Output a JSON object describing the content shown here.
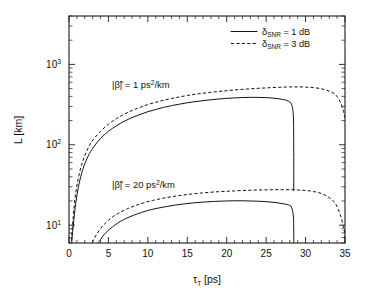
{
  "chart_data": {
    "type": "line",
    "title": "",
    "xlabel": "τ_T  [ps]",
    "xlabel_main": "τ",
    "xlabel_sub": "T",
    "xlabel_unit": "[ps]",
    "ylabel_main": "L",
    "ylabel_unit": "[km]",
    "ylabel": "L  [km]",
    "xlim": [
      0,
      35
    ],
    "ylim": [
      6,
      4000
    ],
    "yscale": "log",
    "xscale": "linear",
    "grid": false,
    "xticks": [
      0,
      5,
      10,
      15,
      20,
      25,
      30,
      35
    ],
    "xticklabels": [
      "0",
      "5",
      "10",
      "15",
      "20",
      "25",
      "30",
      "35"
    ],
    "yticks": [
      10,
      100,
      1000
    ],
    "yticklabels": [
      "10",
      "10",
      "10"
    ],
    "yticklabel_exponents": [
      "1",
      "2",
      "3"
    ],
    "ytick_bases": [
      "10",
      "10",
      "10"
    ],
    "legend_position": "top-right",
    "legend": [
      {
        "label_main": "δ",
        "label_sub": "SNR",
        "label_rest": " = 1 dB",
        "style": "solid",
        "full": "δ_SNR = 1 dB"
      },
      {
        "label_main": "δ",
        "label_sub": "SNR",
        "label_rest": " = 3 dB",
        "style": "dashed",
        "full": "δ_SNR = 3 dB"
      }
    ],
    "annotations": [
      {
        "text": "|β̃| = 1 ps²/km",
        "prefix": "|β̃| = 1 ps",
        "sup": "2",
        "suffix": "/km",
        "x_px": 112,
        "y_px": 88
      },
      {
        "text": "|β̃| = 20 ps²/km",
        "prefix": "|β̃| = 20 ps",
        "sup": "2",
        "suffix": "/km",
        "x_px": 112,
        "y_px": 188
      }
    ],
    "series": [
      {
        "name": "beta=1 ps^2/km, delta_SNR=1 dB",
        "style": "solid",
        "beta": 1,
        "delta_snr_dB": 1,
        "x": [
          0.35,
          0.5,
          0.7,
          0.9,
          1.2,
          1.6,
          2.0,
          2.6,
          3.2,
          4.0,
          5.0,
          6.0,
          7.0,
          8.0,
          9.0,
          10.0,
          11.0,
          12.0,
          13.0,
          14.0,
          15.0,
          16.0,
          17.0,
          18.0,
          19.0,
          20.0,
          21.0,
          22.0,
          23.0,
          24.0,
          25.0,
          26.0,
          27.0,
          27.8,
          28.2,
          28.45,
          28.5,
          28.5
        ],
        "y": [
          6.2,
          9.0,
          14.0,
          20.0,
          30.0,
          44.0,
          58.0,
          78.0,
          96.0,
          120.0,
          147.0,
          172.0,
          196.0,
          218.0,
          238.0,
          258.0,
          275.0,
          292.0,
          307.0,
          320.0,
          333.0,
          344.0,
          354.0,
          363.0,
          371.0,
          378.0,
          383.0,
          387.0,
          389.0,
          389.0,
          386.0,
          380.0,
          368.0,
          350.0,
          320.0,
          230.0,
          80.0,
          27.0
        ]
      },
      {
        "name": "beta=1 ps^2/km, delta_SNR=3 dB",
        "style": "dashed",
        "beta": 1,
        "delta_snr_dB": 3,
        "x": [
          0.3,
          0.45,
          0.6,
          0.8,
          1.1,
          1.5,
          1.9,
          2.5,
          3.1,
          4.0,
          5.0,
          6.0,
          7.0,
          8.0,
          9.0,
          10.0,
          11.0,
          12.0,
          13.0,
          14.0,
          15.0,
          16.0,
          17.0,
          18.0,
          19.0,
          20.0,
          21.0,
          22.0,
          23.0,
          24.0,
          25.0,
          26.0,
          27.0,
          28.0,
          29.0,
          30.0,
          31.0,
          32.0,
          33.0,
          33.8,
          34.4,
          34.8,
          35.0,
          35.0
        ],
        "y": [
          6.4,
          10.0,
          15.0,
          23.0,
          35.0,
          52.0,
          69.0,
          94.0,
          117.0,
          147.0,
          180.0,
          211.0,
          240.0,
          267.0,
          292.0,
          316.0,
          338.0,
          358.0,
          377.0,
          394.0,
          410.0,
          425.0,
          438.0,
          450.0,
          461.0,
          471.0,
          481.0,
          489.0,
          497.0,
          504.0,
          510.0,
          516.0,
          521.0,
          524.0,
          525.0,
          522.0,
          514.0,
          497.0,
          465.0,
          420.0,
          340.0,
          260.0,
          215.0,
          200.0
        ]
      },
      {
        "name": "beta=20 ps^2/km, delta_SNR=1 dB",
        "style": "solid",
        "beta": 20,
        "delta_snr_dB": 1,
        "x": [
          3.75,
          4.0,
          4.3,
          4.7,
          5.2,
          5.8,
          6.5,
          7.3,
          8.2,
          9.2,
          10.2,
          11.3,
          12.4,
          13.5,
          14.6,
          15.7,
          16.8,
          17.9,
          19.0,
          20.0,
          21.0,
          22.0,
          23.0,
          24.0,
          25.0,
          26.0,
          27.0,
          27.8,
          28.2,
          28.45,
          28.5,
          28.5
        ],
        "y": [
          6.1,
          6.6,
          7.3,
          8.1,
          9.0,
          10.0,
          11.1,
          12.2,
          13.3,
          14.4,
          15.4,
          16.3,
          17.1,
          17.8,
          18.4,
          18.9,
          19.3,
          19.6,
          19.85,
          20.0,
          20.1,
          20.1,
          20.0,
          19.85,
          19.6,
          19.2,
          18.6,
          17.9,
          16.8,
          13.0,
          8.5,
          6.1
        ]
      },
      {
        "name": "beta=20 ps^2/km, delta_SNR=3 dB",
        "style": "dashed",
        "beta": 20,
        "delta_snr_dB": 3,
        "x": [
          2.95,
          3.2,
          3.5,
          3.9,
          4.4,
          5.0,
          5.7,
          6.5,
          7.4,
          8.4,
          9.5,
          10.6,
          11.8,
          13.0,
          14.2,
          15.4,
          16.6,
          17.8,
          19.0,
          20.0,
          21.0,
          22.0,
          23.0,
          24.0,
          25.0,
          26.0,
          27.0,
          28.0,
          29.0,
          30.0,
          31.0,
          32.0,
          33.0,
          33.8,
          34.4,
          34.8,
          35.0,
          35.0
        ],
        "y": [
          6.1,
          6.8,
          7.7,
          8.8,
          10.1,
          11.5,
          13.0,
          14.5,
          16.0,
          17.5,
          19.0,
          20.3,
          21.5,
          22.6,
          23.5,
          24.3,
          25.0,
          25.6,
          26.1,
          26.4,
          26.7,
          27.0,
          27.2,
          27.4,
          27.5,
          27.6,
          27.65,
          27.6,
          27.4,
          27.0,
          26.2,
          24.8,
          22.0,
          18.5,
          13.5,
          9.5,
          7.5,
          6.1
        ]
      }
    ]
  },
  "figure": {
    "plot_area": {
      "left_px": 69,
      "top_px": 16,
      "right_px": 345,
      "bottom_px": 243
    }
  }
}
